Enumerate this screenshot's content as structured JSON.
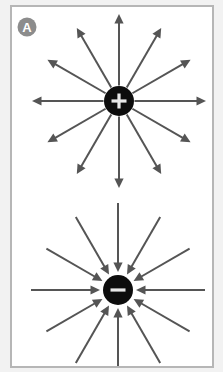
{
  "panel": {
    "label_badge": "A",
    "background_color": "#ffffff",
    "border_color": "#b6b6b6",
    "outer_background_color": "#f2f2f2",
    "badge_color": "#8c8c8c",
    "badge_text_color": "#ffffff"
  },
  "diagram": {
    "arrow_color": "#555555",
    "charge_fill_color": "#0d0d0d",
    "sign_color": "#e8e8e8",
    "arrow_count_per_charge": 12,
    "arrow_angle_step_degrees": 30,
    "charges": [
      {
        "id": "positive-charge",
        "sign": "+",
        "label": "positive point charge",
        "field_direction": "outward",
        "center_x": 107,
        "center_y": 94,
        "radius": 15,
        "arrow_reach": 87
      },
      {
        "id": "negative-charge",
        "sign": "–",
        "label": "negative point charge",
        "field_direction": "inward",
        "center_x": 106,
        "center_y": 283,
        "radius": 15,
        "arrow_reach": 87
      }
    ]
  }
}
